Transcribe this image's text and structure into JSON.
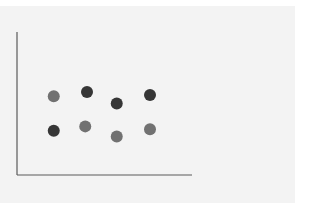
{
  "chart_data": {
    "type": "scatter",
    "title": "",
    "xlabel": "",
    "ylabel": "",
    "xlim": [
      0,
      10
    ],
    "ylim": [
      0,
      10
    ],
    "grid": false,
    "legend": null,
    "series": [
      {
        "name": "dark",
        "color": "#363636",
        "points": [
          {
            "x": 2.1,
            "y": 3.1
          },
          {
            "x": 4.0,
            "y": 5.8
          },
          {
            "x": 5.7,
            "y": 5.0
          },
          {
            "x": 7.6,
            "y": 5.6
          }
        ]
      },
      {
        "name": "medium",
        "color": "#717171",
        "points": [
          {
            "x": 2.1,
            "y": 5.5
          },
          {
            "x": 3.9,
            "y": 3.4
          },
          {
            "x": 5.7,
            "y": 2.7
          },
          {
            "x": 7.6,
            "y": 3.2
          }
        ]
      }
    ]
  },
  "layout": {
    "plot_left": 17,
    "plot_right": 192,
    "plot_top": 32,
    "plot_bottom": 175,
    "marker_radius": 6,
    "axis_color": "#5a5a5a",
    "panel_color": "#f3f3f3"
  }
}
